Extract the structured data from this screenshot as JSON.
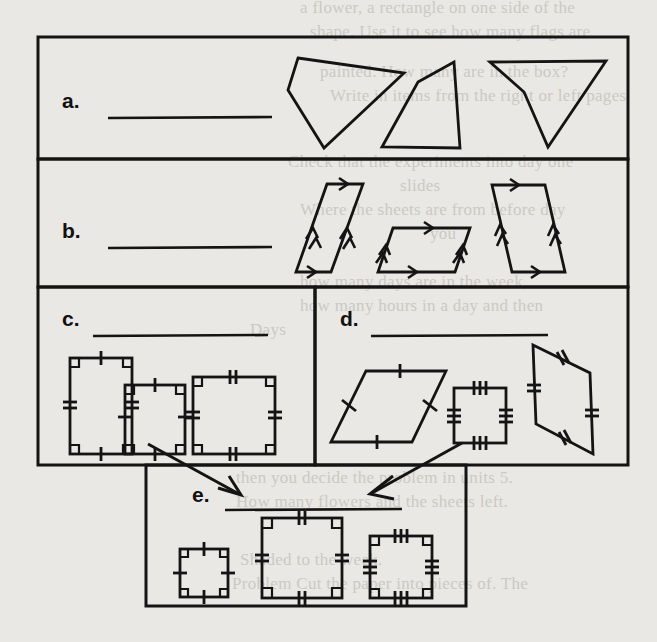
{
  "worksheet": {
    "title": "Quadrilateral Classification Chart",
    "background_color": "#e9e8e4",
    "ink_color": "#141414",
    "sections": [
      {
        "id": "a",
        "label": "a.",
        "answer_line": "",
        "answer_placeholder": "",
        "category_hint": "quadrilaterals",
        "figure_count": 3,
        "figures": [
          "irregular-quadrilateral",
          "irregular-quadrilateral",
          "concave-quadrilateral"
        ],
        "marks": "none"
      },
      {
        "id": "b",
        "label": "b.",
        "answer_line": "",
        "answer_placeholder": "",
        "category_hint": "parallelograms",
        "figure_count": 3,
        "figures": [
          "parallelogram",
          "parallelogram",
          "parallelogram"
        ],
        "marks": "parallel-arrows"
      },
      {
        "id": "c",
        "label": "c.",
        "answer_line": "",
        "answer_placeholder": "",
        "category_hint": "rectangles",
        "figure_count": 3,
        "figures": [
          "rectangle-tall",
          "rectangle-square",
          "rectangle-wide"
        ],
        "marks": "right-angles-and-congruent-ticks"
      },
      {
        "id": "d",
        "label": "d.",
        "answer_line": "",
        "answer_placeholder": "",
        "category_hint": "rhombuses",
        "figure_count": 3,
        "figures": [
          "rhombus-wide",
          "rhombus-square",
          "rhombus-tall"
        ],
        "marks": "four-equal-side-ticks"
      },
      {
        "id": "e",
        "label": "e.",
        "answer_line": "",
        "answer_placeholder": "",
        "category_hint": "squares",
        "figure_count": 3,
        "figures": [
          "square-small",
          "square-large",
          "square-medium"
        ],
        "marks": "right-angles-and-four-equal-ticks"
      }
    ],
    "arrows": [
      {
        "name": "arrow-c-to-e",
        "from_section": "c",
        "to_section": "e",
        "direction": "down-right"
      },
      {
        "name": "arrow-d-to-e",
        "from_section": "d",
        "to_section": "e",
        "direction": "down-left"
      }
    ],
    "bleed_text": [
      "a flower, a rectangle on one side of the",
      "shape. Use it to see how many flags are",
      "painted. How many are in the box?",
      "Write in items from the right or left pages",
      "Check that the experiments into day one",
      "slides",
      "Where the sheets are from before day",
      "you",
      "how many days are in the week,",
      "how many hours in a day and then",
      "Days",
      "then you decide the problem in units 5.",
      "How many flowers and the sheets left.",
      "Shaded to the week.",
      "Problem  Cut the paper into pieces of. The"
    ]
  }
}
